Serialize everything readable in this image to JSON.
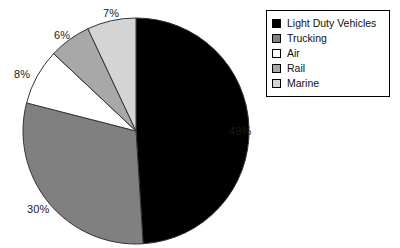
{
  "chart_data": {
    "type": "pie",
    "title": "",
    "subtitle": "",
    "xlabel": "",
    "ylabel": "",
    "grid": false,
    "legend_position": "top-right",
    "start_angle_deg": 0,
    "direction": "clockwise",
    "unit": "%",
    "categories": [
      "Light Duty Vehicles",
      "Trucking",
      "Air",
      "Rail",
      "Marine"
    ],
    "values": [
      49,
      30,
      8,
      6,
      7
    ],
    "data_labels": [
      "49%",
      "30%",
      "8%",
      "6%",
      "7%"
    ],
    "colors": [
      "#000000",
      "#808080",
      "#ffffff",
      "#a8a8a8",
      "#d4d4d4"
    ],
    "slices": [
      {
        "label": "Light Duty Vehicles",
        "value": 49,
        "data_label": "49%",
        "color": "#000000"
      },
      {
        "label": "Trucking",
        "value": 30,
        "data_label": "30%",
        "color": "#808080"
      },
      {
        "label": "Air",
        "value": 8,
        "data_label": "8%",
        "color": "#ffffff"
      },
      {
        "label": "Rail",
        "value": 6,
        "data_label": "6%",
        "color": "#a8a8a8"
      },
      {
        "label": "Marine",
        "value": 7,
        "data_label": "7%",
        "color": "#d4d4d4"
      }
    ]
  },
  "pie": {
    "labels": {
      "light_duty_vehicles": "49%",
      "trucking": "30%",
      "air": "8%",
      "rail": "6%",
      "marine": "7%"
    },
    "outline_color": "#333333",
    "center_x": 136,
    "center_y": 131,
    "radius": 113
  },
  "legend": {
    "border_color": "#000000",
    "background": "#ffffff",
    "items": [
      {
        "label": "Light Duty Vehicles",
        "color": "#000000"
      },
      {
        "label": "Trucking",
        "color": "#808080"
      },
      {
        "label": "Air",
        "color": "#ffffff"
      },
      {
        "label": "Rail",
        "color": "#a8a8a8"
      },
      {
        "label": "Marine",
        "color": "#d4d4d4"
      }
    ]
  }
}
